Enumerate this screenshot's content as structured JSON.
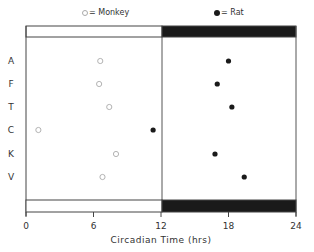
{
  "legend": {
    "monkey_label": "= Monkey",
    "rat_label": "= Rat"
  },
  "axis": {
    "xlabel": "Circadian Time (hrs)",
    "ticks": [
      "0",
      "6",
      "12",
      "18",
      "24"
    ]
  },
  "colors": {
    "dark_band": "#1a1a1a",
    "monkey_marker": "#aaaaaa",
    "rat_marker": "#1a1a1a"
  },
  "chart_data": {
    "type": "scatter",
    "title": "",
    "xlabel": "Circadian Time (hrs)",
    "ylabel": "",
    "xlim": [
      0,
      24
    ],
    "xticks": [
      0,
      6,
      12,
      18,
      24
    ],
    "categories": [
      "A",
      "F",
      "T",
      "C",
      "K",
      "V"
    ],
    "series": [
      {
        "name": "Monkey",
        "marker": "open-circle",
        "values": [
          6.6,
          6.5,
          7.4,
          1.1,
          8.0,
          6.8
        ]
      },
      {
        "name": "Rat",
        "marker": "filled-circle",
        "values": [
          18.0,
          17.0,
          18.3,
          11.3,
          16.8,
          19.4
        ]
      }
    ],
    "light_dark_bars": {
      "light": [
        0,
        12
      ],
      "dark": [
        12,
        24
      ]
    },
    "grid": false,
    "legend_position": "top"
  }
}
